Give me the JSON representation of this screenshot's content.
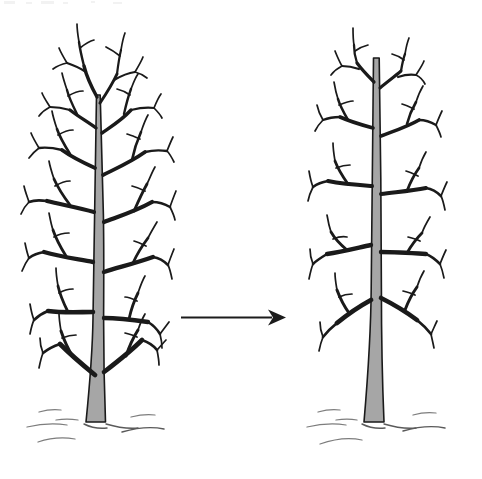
{
  "figure": {
    "title": "Tree pruning before and after diagram",
    "background_color": "#ffffff",
    "line_color": "#1a1a1a",
    "trunk_fill_color": "#a6a6a6",
    "ground_color": "#7d7d7d",
    "arrow_color": "#1c1c1c",
    "width": 482,
    "height": 479
  },
  "left_tree": {
    "label": "unpruned-tree",
    "description": "Bare deciduous tree with dense untrimmed branching, tall narrow crown",
    "top_y": 38,
    "base_y": 425,
    "left_x": 28,
    "right_x": 168,
    "trunk_base_width": 22,
    "trunk_color": "#a6a6a6"
  },
  "right_tree": {
    "label": "pruned-tree",
    "description": "Same tree after pruning, fewer and shorter branches, shorter crown",
    "top_y": 55,
    "base_y": 425,
    "left_x": 308,
    "right_x": 462,
    "trunk_base_width": 22,
    "trunk_color": "#a6a6a6"
  },
  "arrow": {
    "label": "transformation-arrow",
    "direction": "left-to-right",
    "start_x": 181,
    "end_x": 286,
    "y": 317,
    "color": "#1c1c1c"
  },
  "ground": {
    "label": "ground-hatch-marks",
    "left_tree_marks": 7,
    "right_tree_marks": 7,
    "baseline_y": 425
  }
}
